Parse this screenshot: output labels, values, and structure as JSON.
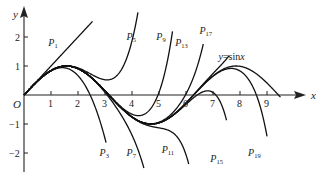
{
  "chart_data": {
    "type": "line",
    "title": "",
    "xlabel": "x",
    "ylabel": "y",
    "origin_label": "O",
    "xlim": [
      0,
      9.8
    ],
    "ylim": [
      -2.6,
      2.9
    ],
    "x_ticks": [
      1,
      2,
      3,
      4,
      5,
      6,
      7,
      8,
      9
    ],
    "y_ticks": [
      -2,
      -1,
      1,
      2
    ],
    "grid": false,
    "legend": "none (inline curve labels)",
    "series": [
      {
        "name": "y=sinx",
        "label": "y=sinx",
        "function": "sin(x)",
        "x_range": [
          0,
          9.5
        ]
      },
      {
        "name": "P1",
        "label": "P",
        "subscript": "1",
        "degree": 1,
        "x_range": [
          0,
          2.55
        ]
      },
      {
        "name": "P3",
        "label": "P",
        "subscript": "3",
        "degree": 3,
        "x_range": [
          0,
          3.05
        ]
      },
      {
        "name": "P5",
        "label": "P",
        "subscript": "5",
        "degree": 5,
        "x_range": [
          0,
          4.95
        ]
      },
      {
        "name": "P7",
        "label": "P",
        "subscript": "7",
        "degree": 7,
        "x_range": [
          0,
          4.45
        ]
      },
      {
        "name": "P9",
        "label": "P",
        "subscript": "9",
        "degree": 9,
        "x_range": [
          0,
          5.5
        ]
      },
      {
        "name": "P11",
        "label": "P",
        "subscript": "11",
        "degree": 11,
        "x_range": [
          0,
          6.1
        ]
      },
      {
        "name": "P13",
        "label": "P",
        "subscript": "13",
        "degree": 13,
        "x_range": [
          0,
          6.65
        ]
      },
      {
        "name": "P15",
        "label": "P",
        "subscript": "15",
        "degree": 15,
        "x_range": [
          0,
          7.5
        ]
      },
      {
        "name": "P17",
        "label": "P",
        "subscript": "17",
        "degree": 17,
        "x_range": [
          0,
          7.6
        ]
      },
      {
        "name": "P19",
        "label": "P",
        "subscript": "19",
        "degree": 19,
        "x_range": [
          0,
          9.0
        ]
      }
    ],
    "annotations": [
      {
        "text": "P1",
        "x": 0.9,
        "y": 1.7
      },
      {
        "text": "P3",
        "x": 2.8,
        "y": -2.1
      },
      {
        "text": "P5",
        "x": 3.8,
        "y": 1.9
      },
      {
        "text": "P7",
        "x": 3.8,
        "y": -2.1
      },
      {
        "text": "P9",
        "x": 4.9,
        "y": 1.9
      },
      {
        "text": "P11",
        "x": 5.1,
        "y": -2.0
      },
      {
        "text": "P13",
        "x": 5.6,
        "y": 1.7
      },
      {
        "text": "P15",
        "x": 6.9,
        "y": -2.3
      },
      {
        "text": "P17",
        "x": 6.5,
        "y": 2.1
      },
      {
        "text": "P19",
        "x": 8.3,
        "y": -2.1
      },
      {
        "text": "y=sinx",
        "x": 7.2,
        "y": 1.2
      }
    ]
  },
  "axes": {
    "x_name": "x",
    "y_name": "y",
    "origin": "O"
  }
}
